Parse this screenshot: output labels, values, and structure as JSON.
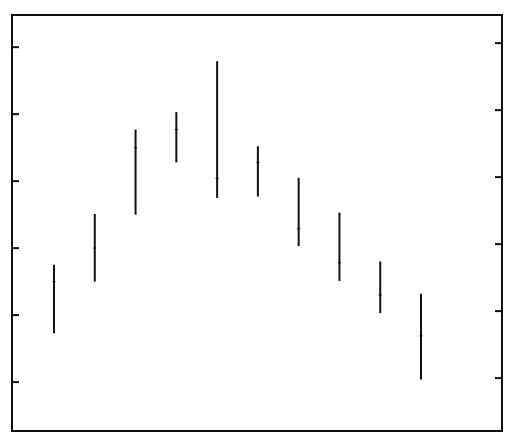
{
  "chart_data": {
    "type": "range-bar",
    "title": "",
    "xlabel": "",
    "ylabel": "",
    "categories": [
      "1",
      "2",
      "3",
      "4",
      "5",
      "6",
      "7",
      "8",
      "9",
      "10"
    ],
    "series": [
      {
        "name": "low",
        "values": [
          0.73,
          1.5,
          2.5,
          3.28,
          2.75,
          2.77,
          2.03,
          1.51,
          1.03,
          0.04
        ]
      },
      {
        "name": "high",
        "values": [
          1.75,
          2.51,
          3.77,
          4.03,
          4.79,
          3.52,
          3.05,
          2.53,
          1.8,
          1.32
        ]
      },
      {
        "name": "mid",
        "values": [
          1.5,
          2.0,
          3.5,
          3.77,
          3.04,
          3.28,
          2.29,
          1.78,
          1.3,
          0.69
        ]
      }
    ],
    "yticks": [
      0,
      1,
      2,
      3,
      4,
      5
    ],
    "ytick_labels": [],
    "ylim": [
      -0.73,
      5.48
    ],
    "grid": false,
    "legend": null,
    "frame": true,
    "ticks_on_both_sides": true
  },
  "colors": {
    "line": "#111111",
    "background": "#ffffff"
  }
}
